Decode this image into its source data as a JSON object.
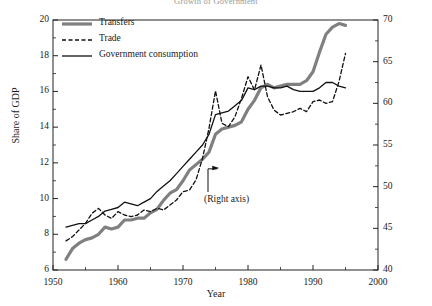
{
  "chart_data": {
    "type": "line",
    "title": "Growth of Government",
    "xlabel": "Year",
    "ylabel": "Share of GDP",
    "ylabel_right": "",
    "xlim": [
      1950,
      2000
    ],
    "ylim": [
      6,
      20
    ],
    "ylim_right": [
      40,
      70
    ],
    "xticks": [
      1950,
      1960,
      1970,
      1980,
      1990,
      2000
    ],
    "xticks_minor": [
      1955,
      1965,
      1975,
      1985,
      1995
    ],
    "yticks_left": [
      6,
      8,
      10,
      12,
      14,
      16,
      18,
      20
    ],
    "yticks_right": [
      40,
      45,
      50,
      55,
      60,
      65,
      70
    ],
    "grid": false,
    "legend_position": "top-left",
    "annotations": [
      {
        "text": "(Right axis)",
        "points_to_series": "Trade",
        "x": 1974.5,
        "y_right": 52.5
      }
    ],
    "series": [
      {
        "name": "Transfers",
        "axis": "left",
        "style": "solid-thick",
        "color": "#808080",
        "linewidth": 3.2,
        "x": [
          1952,
          1953,
          1954,
          1955,
          1956,
          1957,
          1958,
          1959,
          1960,
          1961,
          1962,
          1963,
          1964,
          1965,
          1966,
          1967,
          1968,
          1969,
          1970,
          1971,
          1972,
          1973,
          1974,
          1975,
          1976,
          1977,
          1978,
          1979,
          1980,
          1981,
          1982,
          1983,
          1984,
          1985,
          1986,
          1987,
          1988,
          1989,
          1990,
          1991,
          1992,
          1993,
          1994,
          1995
        ],
        "y": [
          6.6,
          7.2,
          7.5,
          7.7,
          7.8,
          8.0,
          8.4,
          8.3,
          8.4,
          8.8,
          8.8,
          8.9,
          8.9,
          9.2,
          9.4,
          9.9,
          10.3,
          10.5,
          11.0,
          11.6,
          11.9,
          12.2,
          12.6,
          13.6,
          13.9,
          14.0,
          14.1,
          14.3,
          15.0,
          15.5,
          16.2,
          16.4,
          16.2,
          16.3,
          16.4,
          16.4,
          16.4,
          16.6,
          17.1,
          18.2,
          19.2,
          19.6,
          19.8,
          19.7
        ]
      },
      {
        "name": "Trade",
        "axis": "right",
        "style": "dashed",
        "color": "#111111",
        "linewidth": 1.3,
        "x": [
          1952,
          1953,
          1954,
          1955,
          1956,
          1957,
          1958,
          1959,
          1960,
          1961,
          1962,
          1963,
          1964,
          1965,
          1966,
          1967,
          1968,
          1969,
          1970,
          1971,
          1972,
          1973,
          1974,
          1975,
          1976,
          1977,
          1978,
          1979,
          1980,
          1981,
          1982,
          1983,
          1984,
          1985,
          1986,
          1987,
          1988,
          1989,
          1990,
          1991,
          1992,
          1993,
          1994,
          1995
        ],
        "y": [
          43.5,
          44.0,
          44.8,
          45.6,
          46.8,
          47.4,
          46.6,
          46.2,
          47.0,
          46.6,
          46.4,
          46.6,
          47.2,
          47.0,
          47.4,
          47.2,
          47.8,
          48.4,
          49.4,
          49.6,
          50.8,
          53.4,
          57.0,
          61.5,
          57.6,
          57.2,
          58.4,
          60.6,
          63.2,
          61.6,
          64.6,
          60.8,
          59.2,
          58.6,
          58.8,
          59.0,
          59.4,
          59.0,
          60.2,
          60.4,
          60.0,
          60.2,
          62.6,
          66.0
        ]
      },
      {
        "name": "Government consumption",
        "axis": "left",
        "style": "solid-thin",
        "color": "#111111",
        "linewidth": 1.3,
        "x": [
          1952,
          1953,
          1954,
          1955,
          1956,
          1957,
          1958,
          1959,
          1960,
          1961,
          1962,
          1963,
          1964,
          1965,
          1966,
          1967,
          1968,
          1969,
          1970,
          1971,
          1972,
          1973,
          1974,
          1975,
          1976,
          1977,
          1978,
          1979,
          1980,
          1981,
          1982,
          1983,
          1984,
          1985,
          1986,
          1987,
          1988,
          1989,
          1990,
          1991,
          1992,
          1993,
          1994,
          1995
        ],
        "y": [
          8.4,
          8.5,
          8.6,
          8.6,
          8.8,
          9.0,
          9.3,
          9.4,
          9.5,
          9.8,
          9.7,
          9.6,
          9.8,
          10.0,
          10.4,
          10.7,
          11.0,
          11.4,
          11.8,
          12.2,
          12.6,
          13.0,
          13.6,
          14.7,
          14.8,
          14.9,
          15.2,
          15.5,
          16.2,
          16.1,
          16.3,
          16.3,
          16.2,
          16.2,
          16.3,
          16.1,
          16.0,
          16.0,
          16.0,
          16.2,
          16.5,
          16.5,
          16.3,
          16.2
        ]
      }
    ]
  },
  "legend": {
    "items": [
      {
        "label": "Transfers",
        "style": "solid-thick"
      },
      {
        "label": "Trade",
        "style": "dashed"
      },
      {
        "label": "Government consumption",
        "style": "solid-thin"
      }
    ]
  },
  "axes": {
    "left_title": "Share of GDP",
    "bottom_title": "Year"
  }
}
